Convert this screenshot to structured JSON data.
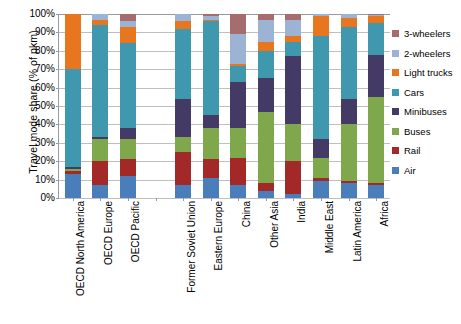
{
  "chart_data": {
    "type": "bar",
    "stacked": true,
    "stacked_mode": "percent",
    "title": "",
    "xlabel": "",
    "ylabel": "Travel mode share (% of pkm)",
    "ylim": [
      0,
      100
    ],
    "ytick_labels": [
      "0%",
      "10%",
      "20%",
      "30%",
      "40%",
      "50%",
      "60%",
      "70%",
      "80%",
      "90%",
      "100%"
    ],
    "ytick_values": [
      0,
      10,
      20,
      30,
      40,
      50,
      60,
      70,
      80,
      90,
      100
    ],
    "grid": true,
    "legend_position": "right",
    "categories": [
      "OECD North America",
      "OECD Europe",
      "OECD Pacific",
      "",
      "Former Soviet Union",
      "Eastern Europe",
      "China",
      "Other Asia",
      "India",
      "Middle East",
      "Latin America",
      "Africa"
    ],
    "series": [
      {
        "name": "Air",
        "color": "#4a7ebb",
        "values": [
          13.0,
          7.0,
          12.0,
          0,
          7.0,
          11.0,
          7.0,
          4.0,
          2.0,
          9.0,
          8.0,
          7.0
        ]
      },
      {
        "name": "Rail",
        "color": "#a32929",
        "values": [
          1.5,
          13.0,
          9.0,
          0,
          18.0,
          10.0,
          15.0,
          4.0,
          18.0,
          2.0,
          1.0,
          1.0
        ]
      },
      {
        "name": "Buses",
        "color": "#7fa74c",
        "values": [
          1.5,
          12.0,
          11.0,
          0,
          8.0,
          17.0,
          16.0,
          39.0,
          20.0,
          11.0,
          31.0,
          47.0
        ]
      },
      {
        "name": "Minibuses",
        "color": "#433b66",
        "values": [
          1.0,
          1.0,
          6.0,
          0,
          21.0,
          7.0,
          25.0,
          18.0,
          37.0,
          10.0,
          14.0,
          23.0
        ]
      },
      {
        "name": "Cars",
        "color": "#4098ae",
        "values": [
          53.0,
          61.0,
          46.0,
          0,
          38.0,
          51.0,
          9.0,
          15.0,
          8.0,
          56.0,
          39.0,
          17.0
        ]
      },
      {
        "name": "Light trucks",
        "color": "#e8761f",
        "values": [
          30.0,
          3.0,
          9.0,
          0,
          4.0,
          1.0,
          1.0,
          5.0,
          3.0,
          11.0,
          5.0,
          4.0
        ]
      },
      {
        "name": "2-wheelers",
        "color": "#9cb3d4",
        "values": [
          0.0,
          3.0,
          3.0,
          0,
          4.0,
          2.0,
          16.0,
          12.0,
          9.0,
          1.0,
          2.0,
          0.5
        ]
      },
      {
        "name": "3-wheelers",
        "color": "#a56d6d",
        "values": [
          0.0,
          0.0,
          4.0,
          0,
          0.0,
          1.0,
          11.0,
          3.0,
          3.0,
          0.0,
          0.0,
          0.5
        ]
      }
    ]
  },
  "legend": {
    "items": [
      {
        "label": "3-wheelers",
        "color": "#a56d6d"
      },
      {
        "label": "2-wheelers",
        "color": "#9cb3d4"
      },
      {
        "label": "Light trucks",
        "color": "#e8761f"
      },
      {
        "label": "Cars",
        "color": "#4098ae"
      },
      {
        "label": "Minibuses",
        "color": "#433b66"
      },
      {
        "label": "Buses",
        "color": "#7fa74c"
      },
      {
        "label": "Rail",
        "color": "#a32929"
      },
      {
        "label": "Air",
        "color": "#4a7ebb"
      }
    ]
  }
}
